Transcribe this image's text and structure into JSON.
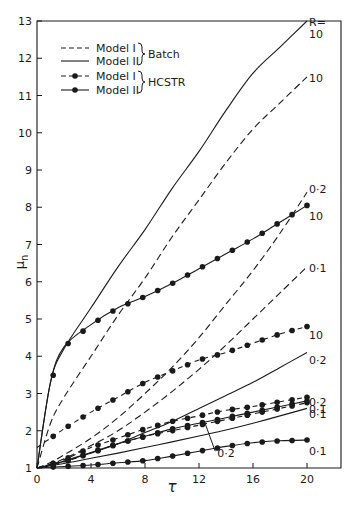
{
  "chart_data": {
    "type": "line",
    "title": "",
    "xlabel": "τ",
    "ylabel": "μn",
    "xlim": [
      0,
      20
    ],
    "ylim": [
      1,
      13
    ],
    "xticks": [
      0,
      4,
      8,
      12,
      16,
      20
    ],
    "yticks": [
      1,
      2,
      3,
      4,
      5,
      6,
      7,
      8,
      9,
      10,
      11,
      12,
      13
    ],
    "grid": false,
    "legend_position": "upper-left",
    "legend": [
      {
        "label": "Model I",
        "style": "dashed",
        "marker": "none",
        "group": "Batch"
      },
      {
        "label": "Model II",
        "style": "solid",
        "marker": "none",
        "group": "Batch"
      },
      {
        "label": "Model I",
        "style": "dashed",
        "marker": "dot",
        "group": "HCSTR"
      },
      {
        "label": "Model II",
        "style": "solid",
        "marker": "dot",
        "group": "HCSTR"
      }
    ],
    "legend_groups": [
      "Batch",
      "HCSTR"
    ],
    "x": [
      0,
      1,
      2,
      4,
      6,
      8,
      10,
      12,
      14,
      16,
      18,
      20
    ],
    "series": [
      {
        "name": "Batch Model II, R=10",
        "style": "solid",
        "marker": "none",
        "end_label": "R=\n10",
        "values": [
          1.0,
          3.3,
          4.2,
          5.3,
          6.4,
          7.4,
          8.5,
          9.5,
          10.6,
          11.6,
          12.3,
          13.0
        ]
      },
      {
        "name": "Batch Model I, R=10",
        "style": "dashed",
        "marker": "none",
        "end_label": "10",
        "values": [
          1.0,
          2.2,
          2.9,
          4.0,
          5.1,
          6.1,
          7.2,
          8.2,
          9.2,
          10.1,
          10.8,
          11.5
        ]
      },
      {
        "name": "Batch Model I, R=0.2",
        "style": "dashed",
        "marker": "none",
        "end_label": "0·2",
        "values": [
          1.0,
          1.15,
          1.35,
          1.8,
          2.35,
          3.0,
          3.7,
          4.5,
          5.4,
          6.3,
          7.3,
          8.4
        ]
      },
      {
        "name": "Batch Model I, R=0.1",
        "style": "dashed",
        "marker": "none",
        "end_label": "0·1",
        "values": [
          1.0,
          1.1,
          1.25,
          1.6,
          2.0,
          2.5,
          3.05,
          3.65,
          4.3,
          5.0,
          5.7,
          6.4
        ]
      },
      {
        "name": "Batch Model II, R=0.2",
        "style": "solid",
        "marker": "none",
        "end_label": "0·2",
        "values": [
          1.0,
          1.08,
          1.18,
          1.4,
          1.65,
          1.95,
          2.25,
          2.6,
          2.95,
          3.3,
          3.7,
          4.1
        ]
      },
      {
        "name": "Batch Model II, R=0.1",
        "style": "solid",
        "marker": "none",
        "end_label": "0·1",
        "values": [
          1.0,
          1.06,
          1.12,
          1.26,
          1.4,
          1.55,
          1.7,
          1.86,
          2.02,
          2.2,
          2.4,
          2.6
        ]
      },
      {
        "name": "HCSTR Model II, R=10",
        "style": "solid",
        "marker": "dot",
        "end_label": "10",
        "values": [
          1.0,
          3.3,
          4.25,
          4.85,
          5.3,
          5.6,
          5.95,
          6.35,
          6.75,
          7.15,
          7.6,
          8.05
        ]
      },
      {
        "name": "HCSTR Model I, R=10",
        "style": "dashed",
        "marker": "dot",
        "end_label": "10",
        "values": [
          1.55,
          1.8,
          2.05,
          2.5,
          2.9,
          3.3,
          3.6,
          3.9,
          4.1,
          4.35,
          4.6,
          4.8
        ]
      },
      {
        "name": "HCSTR Model I, R=0.2",
        "style": "dashed",
        "marker": "dot",
        "end_label": "",
        "values": [
          1.0,
          1.1,
          1.22,
          1.55,
          1.8,
          2.05,
          2.25,
          2.4,
          2.55,
          2.65,
          2.78,
          2.9
        ]
      },
      {
        "name": "HCSTR Model II, R=0.2",
        "style": "solid",
        "marker": "dot",
        "end_label": "0·2",
        "values": [
          1.0,
          1.08,
          1.18,
          1.42,
          1.65,
          1.85,
          2.05,
          2.2,
          2.35,
          2.5,
          2.65,
          2.8
        ]
      },
      {
        "name": "HCSTR Model I, R=0.1",
        "style": "dashed",
        "marker": "dot",
        "end_label": "0·1",
        "values": [
          1.0,
          1.08,
          1.16,
          1.4,
          1.65,
          1.85,
          2.0,
          2.15,
          2.3,
          2.45,
          2.6,
          2.75
        ]
      },
      {
        "name": "HCSTR Model II, R=0.1",
        "style": "solid",
        "marker": "dot",
        "end_label": "0·1",
        "values": [
          1.0,
          1.02,
          1.04,
          1.08,
          1.14,
          1.2,
          1.32,
          1.45,
          1.58,
          1.68,
          1.73,
          1.75
        ]
      }
    ],
    "annotations": [
      {
        "text": "R=",
        "at": "top-right, next to Batch Model II R=10 end"
      },
      {
        "text": "0·2",
        "at": "leader line from τ≈12.3 pointing to HCSTR R=0.2 cluster"
      }
    ]
  },
  "labels": {
    "xlabel": "τ",
    "ylabel_main": "μ",
    "ylabel_sub": "n",
    "legend_batch": "Batch",
    "legend_hcstr": "HCSTR",
    "legend_model1": "Model I",
    "legend_model2": "Model II",
    "r_eq": "R=",
    "inline_02": "0·2"
  },
  "colors": {
    "ink": "#1a1a1a",
    "background": "#ffffff"
  }
}
